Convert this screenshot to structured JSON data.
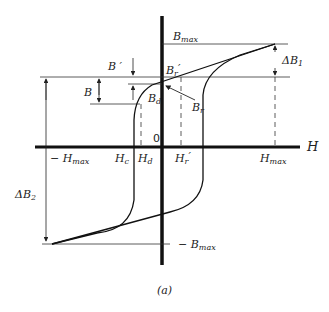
{
  "diagram": {
    "type": "B-H hysteresis loop",
    "caption": "(a)",
    "axes": {
      "x_label": "H",
      "origin_label": "0"
    },
    "labels": {
      "bmax": {
        "main": "B",
        "sub": "max"
      },
      "neg_bmax": {
        "main": "− B",
        "sub": "max"
      },
      "neg_hmax": {
        "main": "− H",
        "sub": "max"
      },
      "hmax": {
        "main": "H",
        "sub": "max"
      },
      "hc": {
        "main": "H",
        "sub": "c"
      },
      "hd": {
        "main": "H",
        "sub": "d"
      },
      "hr_prime": {
        "main": "H",
        "sub": "r",
        "prime": "′"
      },
      "br": {
        "main": "B",
        "sub": "r"
      },
      "br_prime": {
        "main": "B",
        "sub": "r",
        "prime": "′"
      },
      "bd": {
        "main": "B",
        "sub": "d"
      },
      "b": "B",
      "b_prime": "B ′",
      "delta_b1": {
        "main": "ΔB",
        "sub": "1"
      },
      "delta_b2": {
        "main": "ΔB",
        "sub": "2"
      }
    }
  }
}
